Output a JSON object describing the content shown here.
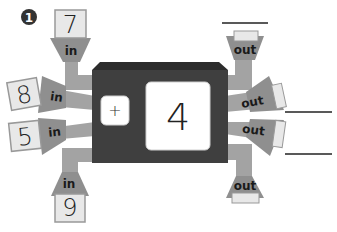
{
  "problem": {
    "number": "1"
  },
  "machine": {
    "operation": "+",
    "operand": "4",
    "colors": {
      "body": "#3d3d3d",
      "top": "#2e2e2e",
      "screen": "#ffffff",
      "pipe": "#a0a0a0",
      "card": "#e6e6e6",
      "card_border": "#9a9a9a"
    }
  },
  "inputs": [
    {
      "label": "in",
      "value": "7",
      "position": "top"
    },
    {
      "label": "in",
      "value": "8",
      "position": "left-upper"
    },
    {
      "label": "in",
      "value": "5",
      "position": "left-lower"
    },
    {
      "label": "in",
      "value": "9",
      "position": "bottom"
    }
  ],
  "outputs": [
    {
      "label": "out",
      "value": "",
      "position": "top"
    },
    {
      "label": "out",
      "value": "",
      "position": "right-upper"
    },
    {
      "label": "out",
      "value": "",
      "position": "right-lower"
    },
    {
      "label": "out",
      "value": "",
      "position": "bottom"
    }
  ]
}
